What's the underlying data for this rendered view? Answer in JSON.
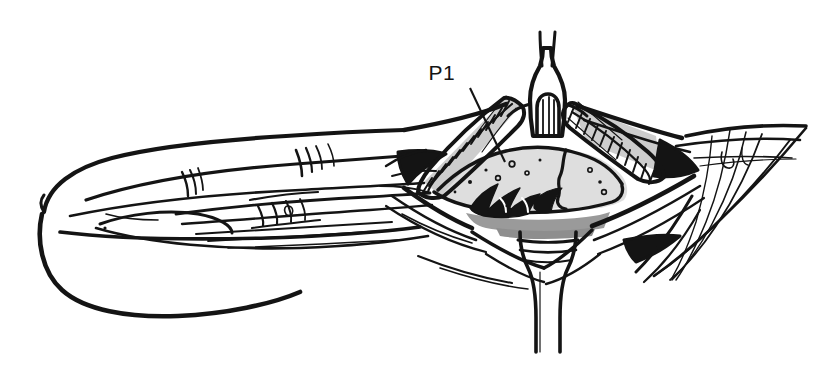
{
  "figure": {
    "caption": "",
    "background_color": "#ffffff",
    "ink_color": "#141414",
    "tones": {
      "ink": "#141414",
      "mid_gray": "#9a9a9a",
      "light_gray": "#c9c9c9",
      "pale_gray": "#dedede",
      "white": "#ffffff"
    },
    "width": 833,
    "height": 365,
    "style": "black-and-white pen-and-ink line drawing with flat gray tones"
  },
  "annotations": [
    {
      "id": "p1",
      "label": "P1",
      "description": "leader line pointing from label down-right to the proximal phalanx region inside the opened sheath",
      "text_x": 455,
      "text_y": 80,
      "leader": {
        "x1": 470,
        "y1": 88,
        "x2": 505,
        "y2": 162
      }
    }
  ],
  "structures": [
    {
      "id": "finger-pulp",
      "name": "finger pulp / distal phalanx",
      "tone": "white"
    },
    {
      "id": "finger-shaft",
      "name": "finger shaft, dorsal contour",
      "tone": "white"
    },
    {
      "id": "proximal-phalanx-bone",
      "name": "exposed proximal phalanx (P1)",
      "tone": "pale_gray"
    },
    {
      "id": "pulley-left",
      "name": "cut pulley edge, left (ladder hatching)",
      "tone": "light_gray"
    },
    {
      "id": "pulley-right",
      "name": "cut pulley edge, right (ladder hatching)",
      "tone": "light_gray"
    },
    {
      "id": "tendon-apex",
      "name": "retracted tendon apex with arched window",
      "tone": "white"
    },
    {
      "id": "tendon-slips",
      "name": "two thin tendon slips rising to top of field",
      "tone": "ink"
    },
    {
      "id": "tendon-stump-lower",
      "name": "banded tendon stump descending below joint",
      "tone": "white"
    },
    {
      "id": "joint-shadow-band",
      "name": "gray shadow band under joint",
      "tone": "mid_gray"
    },
    {
      "id": "fascia-right",
      "name": "sweeping fascia / skin fold lines, right",
      "tone": "white"
    },
    {
      "id": "retractor-wings",
      "name": "retracted skin flaps forming rhomboid window",
      "tone": "white"
    }
  ]
}
